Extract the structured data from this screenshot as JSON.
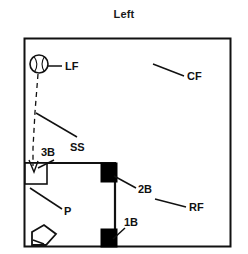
{
  "figure": {
    "title": "Left",
    "type": "baseball-field-diagram",
    "stroke_color": "#111111",
    "fill_color": "#000000",
    "background": "#ffffff"
  },
  "labels": {
    "lf": "LF",
    "cf": "CF",
    "rf": "RF",
    "ss": "SS",
    "b3": "3B",
    "b2": "2B",
    "b1": "1B",
    "p": "P"
  },
  "elements": {
    "ball_icon": "baseball-icon",
    "home_plate": "home-plate-icon",
    "base_3b": "base-unfilled",
    "base_2b": "base-filled",
    "base_1b": "base-filled",
    "trajectory": "dashed-arrow-to-3b"
  },
  "geometry": {
    "outer_box": {
      "x": 24,
      "y": 38,
      "w": 206,
      "h": 208
    },
    "infield": {
      "x": 25,
      "y": 163,
      "w": 90,
      "h": 85
    },
    "ball": {
      "cx": 39,
      "cy": 64,
      "r": 9
    }
  }
}
